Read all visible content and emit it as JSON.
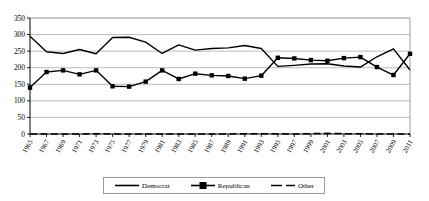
{
  "chart_data": {
    "type": "line",
    "title": "",
    "subtitle": "",
    "xlabel": "",
    "ylabel": "",
    "xlim": [
      1965,
      2011
    ],
    "ylim": [
      0,
      350
    ],
    "yticks": [
      0,
      50,
      100,
      150,
      200,
      250,
      300,
      350
    ],
    "grid": true,
    "grid_axis": "y",
    "legend_position": "bottom",
    "x": [
      1965,
      1967,
      1969,
      1971,
      1973,
      1975,
      1977,
      1979,
      1981,
      1983,
      1985,
      1987,
      1989,
      1991,
      1993,
      1995,
      1997,
      1999,
      2001,
      2003,
      2005,
      2007,
      2009,
      2011
    ],
    "categories": [
      "1965",
      "1967",
      "1969",
      "1971",
      "1973",
      "1975",
      "1977",
      "1979",
      "1981",
      "1983",
      "1985",
      "1987",
      "1989",
      "1991",
      "1993",
      "1995",
      "1997",
      "1999",
      "2001",
      "2003",
      "2005",
      "2007",
      "2009",
      "2011"
    ],
    "series": [
      {
        "name": "Democrat",
        "style": "solid",
        "marker": "none",
        "color": "#000000",
        "values": [
          295,
          248,
          243,
          255,
          242,
          291,
          292,
          277,
          243,
          269,
          253,
          258,
          260,
          267,
          258,
          204,
          207,
          211,
          212,
          205,
          202,
          233,
          257,
          193
        ]
      },
      {
        "name": "Republican",
        "style": "solid",
        "marker": "square",
        "color": "#000000",
        "values": [
          140,
          187,
          192,
          180,
          192,
          144,
          143,
          158,
          192,
          166,
          182,
          177,
          175,
          167,
          176,
          230,
          228,
          223,
          221,
          229,
          232,
          202,
          178,
          242
        ]
      },
      {
        "name": "Other",
        "style": "dashed",
        "marker": "none",
        "color": "#000000",
        "values": [
          0,
          0,
          0,
          0,
          1,
          0,
          0,
          0,
          0,
          0,
          0,
          0,
          0,
          1,
          1,
          1,
          0,
          1,
          2,
          1,
          1,
          0,
          0,
          0
        ]
      }
    ],
    "ytick_labels": [
      "0",
      "50",
      "100",
      "150",
      "200",
      "250",
      "300",
      "350"
    ],
    "axis": {
      "plot_left": 30,
      "plot_right": 410,
      "plot_top": 18,
      "plot_bottom": 134
    }
  },
  "legend": {
    "items": [
      {
        "label": "Democrat",
        "marker": "line-solid"
      },
      {
        "label": "Republican",
        "marker": "line-square"
      },
      {
        "label": "Other",
        "marker": "line-dashed"
      }
    ]
  }
}
